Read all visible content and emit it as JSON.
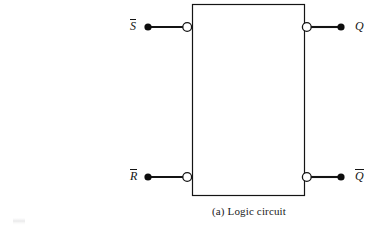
{
  "figure": {
    "caption": "(a) Logic circuit",
    "background_color": "#ffffff",
    "ink_color": "#141414"
  },
  "circuit": {
    "block": {
      "name": "cross-coupled NAND latch block",
      "x": 192,
      "y": 4,
      "width": 113,
      "height": 192,
      "stroke": "#141414",
      "fill": "#ffffff"
    },
    "inputs": [
      {
        "id": "s-bar",
        "label": "S",
        "overbar": true,
        "label_x": 133,
        "label_y": 25,
        "terminal_x": 148,
        "terminal_y": 27,
        "bubble_x": 187,
        "bubble_y": 27,
        "bubble_r": 4.5
      },
      {
        "id": "r-bar",
        "label": "R",
        "overbar": true,
        "label_x": 133,
        "label_y": 176,
        "terminal_x": 148,
        "terminal_y": 177,
        "bubble_x": 187,
        "bubble_y": 177,
        "bubble_r": 4.5
      }
    ],
    "outputs": [
      {
        "id": "q",
        "label": "Q",
        "overbar": false,
        "label_x": 357,
        "label_y": 25,
        "terminal_x": 341,
        "terminal_y": 27,
        "bubble_x": 307,
        "bubble_y": 27,
        "bubble_r": 4.5
      },
      {
        "id": "q-bar",
        "label": "Q",
        "overbar": true,
        "label_x": 357,
        "label_y": 176,
        "terminal_x": 341,
        "terminal_y": 177,
        "bubble_x": 307,
        "bubble_y": 177,
        "bubble_r": 4.5
      }
    ]
  }
}
